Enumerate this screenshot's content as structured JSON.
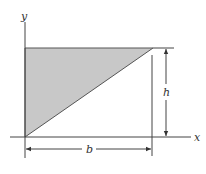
{
  "figure": {
    "axes": {
      "x_label": "x",
      "y_label": "y"
    },
    "dimensions": {
      "base_label": "b",
      "height_label": "h"
    },
    "shape": {
      "type": "right-triangle",
      "description": "Shaded triangle with vertices at origin, (0,h) and (b,h)",
      "fill_color": "#c8c8c8",
      "stroke_color": "#555555"
    },
    "colors": {
      "line": "#444444",
      "fill": "#c8c8c8",
      "background": "#ffffff"
    }
  }
}
